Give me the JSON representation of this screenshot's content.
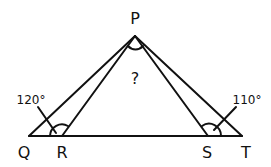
{
  "diagram": {
    "points": {
      "P": {
        "label": "P",
        "x": 135,
        "y": 36
      },
      "Q": {
        "label": "Q",
        "x": 29,
        "y": 136
      },
      "R": {
        "label": "R",
        "x": 62,
        "y": 136
      },
      "S": {
        "label": "S",
        "x": 208,
        "y": 136
      },
      "T": {
        "label": "T",
        "x": 242,
        "y": 136
      }
    },
    "angles": {
      "at_R": {
        "label": "120°",
        "pointer_from": [
          38,
          107
        ],
        "pointer_to": [
          56,
          133
        ]
      },
      "at_S": {
        "label": "110°",
        "pointer_from": [
          236,
          107
        ],
        "pointer_to": [
          214,
          130
        ]
      },
      "at_P": {
        "label": "?"
      }
    },
    "colors": {
      "stroke": "#111111",
      "background": "#ffffff"
    }
  }
}
